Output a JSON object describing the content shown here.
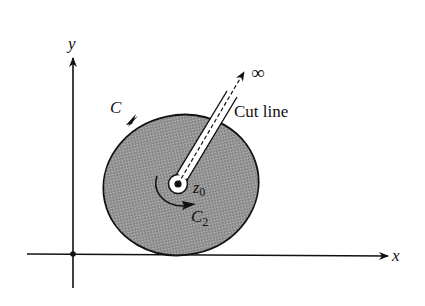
{
  "figure": {
    "axes": {
      "x_label": "x",
      "y_label": "y"
    },
    "region": {
      "boundary_label": "C",
      "fill_color": "#8c8c8c",
      "stroke_color": "#111111"
    },
    "point": {
      "label_main": "z",
      "label_sub": "0"
    },
    "inner_contour": {
      "label_main": "C",
      "label_sub": "2"
    },
    "cut": {
      "label": "Cut line",
      "endpoint_label": "∞"
    }
  }
}
